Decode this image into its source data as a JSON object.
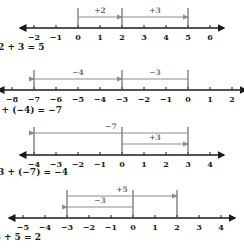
{
  "diagram": {
    "axis_color": "#1a1a1a",
    "span_color": "#8a8a8a",
    "tick_bar_color": "#5a5a5a",
    "rows": [
      {
        "name": "number-line-1",
        "min": -2,
        "max": 6,
        "tick_labels": [
          "−2",
          "−1",
          "0",
          "1",
          "2",
          "3",
          "4",
          "5",
          "6"
        ],
        "tick_values": [
          -2,
          -1,
          0,
          1,
          2,
          3,
          4,
          5,
          6
        ],
        "bars": [
          0,
          2,
          5
        ],
        "spans": [
          {
            "label": "+2",
            "from": 0,
            "to": 2,
            "level": 0,
            "direction": "right"
          },
          {
            "label": "+3",
            "from": 2,
            "to": 5,
            "level": 0,
            "direction": "right"
          }
        ],
        "equation": "2 + 3 = 5"
      },
      {
        "name": "number-line-2",
        "min": -8,
        "max": 2,
        "tick_labels": [
          "−8",
          "−7",
          "−6",
          "−5",
          "−4",
          "−3",
          "−2",
          "−1",
          "0",
          "1",
          "2"
        ],
        "tick_values": [
          -8,
          -7,
          -6,
          -5,
          -4,
          -3,
          -2,
          -1,
          0,
          1,
          2
        ],
        "bars": [
          -7,
          -3,
          0
        ],
        "spans": [
          {
            "label": "−4",
            "from": -3,
            "to": -7,
            "level": 0,
            "direction": "left"
          },
          {
            "label": "−3",
            "from": 0,
            "to": -3,
            "level": 0,
            "direction": "left"
          }
        ],
        "equation": "(−3) + (−4) = −7"
      },
      {
        "name": "number-line-3",
        "min": -4,
        "max": 4,
        "tick_labels": [
          "−4",
          "−3",
          "−2",
          "−1",
          "0",
          "1",
          "2",
          "3",
          "4"
        ],
        "tick_values": [
          -4,
          -3,
          -2,
          -1,
          0,
          1,
          2,
          3,
          4
        ],
        "bars": [
          -4,
          0,
          3
        ],
        "spans": [
          {
            "label": "−7",
            "from": 3,
            "to": -4,
            "level": 1,
            "direction": "left"
          },
          {
            "label": "+3",
            "from": 0,
            "to": 3,
            "level": 0,
            "direction": "right"
          }
        ],
        "equation": "3 + (−7) = −4"
      },
      {
        "name": "number-line-4",
        "min": -5,
        "max": 4,
        "tick_labels": [
          "−5",
          "−4",
          "−3",
          "−2",
          "−1",
          "0",
          "1",
          "2",
          "3",
          "4"
        ],
        "tick_values": [
          -5,
          -4,
          -3,
          -2,
          -1,
          0,
          1,
          2,
          3,
          4
        ],
        "bars": [
          -3,
          0,
          2
        ],
        "spans": [
          {
            "label": "+5",
            "from": -3,
            "to": 2,
            "level": 1,
            "direction": "right"
          },
          {
            "label": "−3",
            "from": 0,
            "to": -3,
            "level": 0,
            "direction": "left"
          }
        ],
        "equation": "−3 + 5 = 2"
      }
    ]
  }
}
